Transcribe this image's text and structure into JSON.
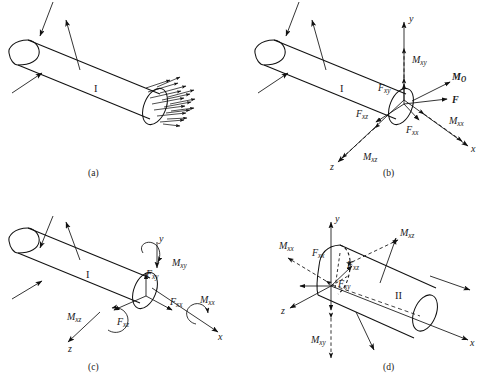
{
  "figure": {
    "background_color": "#ffffff",
    "ink_color": "#111111",
    "panel_count": 4
  },
  "panels": [
    {
      "id": "a",
      "caption": "(a)",
      "segment_label": "I",
      "description": "Cylindrical body segment I with external loads and distributed internal stresses on the cut face",
      "distributed_arrow_count": 17,
      "labels": []
    },
    {
      "id": "b",
      "caption": "(b)",
      "segment_label": "I",
      "description": "Resultant force and moment at the centroid of the cut face, with rectangular components",
      "axes": [
        "y",
        "x",
        "z"
      ],
      "labels": [
        {
          "name": "M_xy",
          "base": "M",
          "sub": "xy",
          "kind": "moment"
        },
        {
          "name": "M_O",
          "base": "M",
          "sub": "O",
          "kind": "resultant-moment",
          "bold": true
        },
        {
          "name": "F",
          "base": "F",
          "sub": "",
          "kind": "resultant-force",
          "bold": true
        },
        {
          "name": "F_xy",
          "base": "F",
          "sub": "xy",
          "kind": "force"
        },
        {
          "name": "F_xz",
          "base": "F",
          "sub": "xz",
          "kind": "force"
        },
        {
          "name": "F_xx",
          "base": "F",
          "sub": "xx",
          "kind": "force"
        },
        {
          "name": "M_xx",
          "base": "M",
          "sub": "xx",
          "kind": "moment"
        },
        {
          "name": "M_xz",
          "base": "M",
          "sub": "xz",
          "kind": "moment"
        }
      ]
    },
    {
      "id": "c",
      "caption": "(c)",
      "segment_label": "I",
      "description": "Same components on segment I, with moments drawn as curved arc arrows",
      "axes": [
        "y",
        "x",
        "z"
      ],
      "labels": [
        {
          "name": "M_xy",
          "base": "M",
          "sub": "xy",
          "kind": "moment-arc"
        },
        {
          "name": "F_xy",
          "base": "F",
          "sub": "xy",
          "kind": "force"
        },
        {
          "name": "F_xx",
          "base": "F",
          "sub": "xx",
          "kind": "force"
        },
        {
          "name": "M_xx",
          "base": "M",
          "sub": "xx",
          "kind": "moment-arc"
        },
        {
          "name": "F_xz",
          "base": "F",
          "sub": "xz",
          "kind": "force"
        },
        {
          "name": "M_xz",
          "base": "M",
          "sub": "xz",
          "kind": "moment-arc"
        }
      ]
    },
    {
      "id": "d",
      "caption": "(d)",
      "segment_label": "II",
      "description": "Complementary segment II showing equal and opposite reactions on its cut face",
      "axes": [
        "y",
        "x",
        "z"
      ],
      "labels": [
        {
          "name": "M_xx",
          "base": "M",
          "sub": "xx",
          "kind": "moment"
        },
        {
          "name": "F_xx",
          "base": "F",
          "sub": "xx",
          "kind": "force"
        },
        {
          "name": "M_xz",
          "base": "M",
          "sub": "xz",
          "kind": "moment"
        },
        {
          "name": "F_xz",
          "base": "F",
          "sub": "xz",
          "kind": "force"
        },
        {
          "name": "F_xy",
          "base": "F",
          "sub": "xy",
          "kind": "force"
        },
        {
          "name": "M_xy",
          "base": "M",
          "sub": "xy",
          "kind": "moment"
        }
      ]
    }
  ],
  "axis_labels": {
    "x": "x",
    "y": "y",
    "z": "z"
  },
  "captions": {
    "a": "(a)",
    "b": "(b)",
    "c": "(c)",
    "d": "(d)"
  },
  "segments": {
    "one": "I",
    "two": "II"
  },
  "text": {
    "M": "M",
    "F": "F",
    "sub_xy": "xy",
    "sub_xz": "xz",
    "sub_xx": "xx",
    "sub_O": "O",
    "M_O_base": "M",
    "F_resultant": "F"
  }
}
